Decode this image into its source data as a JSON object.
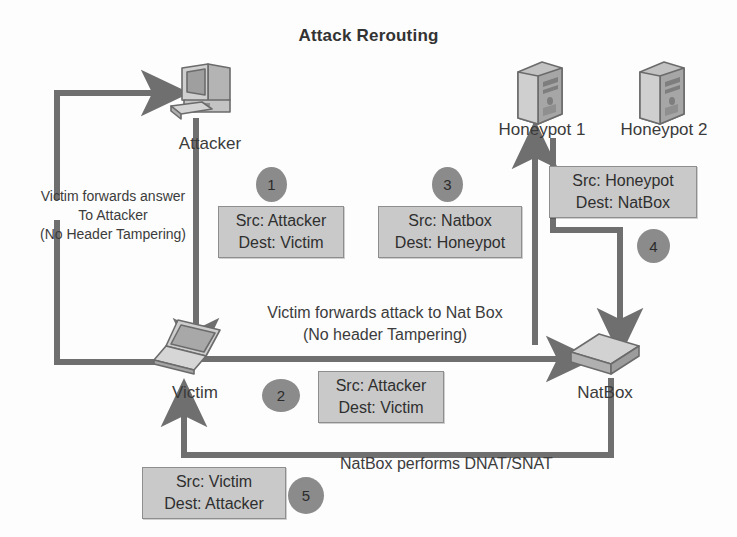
{
  "diagram": {
    "title": "Attack Rerouting",
    "type": "network-flow-diagram",
    "palette": {
      "background": "#fdfdfd",
      "wire": "#6f6f6f",
      "badge_fill": "#8b8b8b",
      "box_fill": "#c9c9c9",
      "box_border": "#8e8e8e",
      "text": "#3b3b3b",
      "device_fill": "#bdbdbd",
      "device_stroke": "#6b6b6b"
    }
  },
  "nodes": [
    {
      "id": "attacker",
      "label": "Attacker",
      "icon": "desktop-computer-icon"
    },
    {
      "id": "victim",
      "label": "Victim",
      "icon": "laptop-icon"
    },
    {
      "id": "honeypot1",
      "label": "Honeypot 1",
      "icon": "server-tower-icon"
    },
    {
      "id": "honeypot2",
      "label": "Honeypot 2",
      "icon": "server-tower-icon"
    },
    {
      "id": "natbox",
      "label": "NatBox",
      "icon": "router-box-icon"
    }
  ],
  "steps": [
    {
      "number": "1",
      "src_line": "Src: Attacker",
      "dest_line": "Dest: Victim",
      "from": "attacker",
      "to": "victim"
    },
    {
      "number": "2",
      "src_line": "Src: Attacker",
      "dest_line": "Dest: Victim",
      "from": "victim",
      "to": "natbox"
    },
    {
      "number": "3",
      "src_line": "Src: Natbox",
      "dest_line": "Dest: Honeypot",
      "from": "natbox",
      "to": "honeypot1"
    },
    {
      "number": "4",
      "src_line": "Src: Honeypot",
      "dest_line": "Dest: NatBox",
      "from": "honeypot1",
      "to": "natbox"
    },
    {
      "number": "5",
      "src_line": "Src: Victim",
      "dest_line": "Dest: Attacker",
      "from": "natbox",
      "to": "victim"
    }
  ],
  "notes": {
    "left": {
      "line1": "Victim forwards answer",
      "line2": "To Attacker",
      "line3": "(No Header Tampering)"
    },
    "middle": {
      "line1": "Victim forwards attack to Nat Box",
      "line2": "(No header Tampering)"
    },
    "bottom": {
      "line1": "NatBox performs DNAT/SNAT"
    }
  }
}
